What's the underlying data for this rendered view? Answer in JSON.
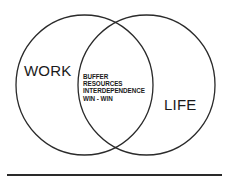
{
  "diagram": {
    "type": "venn",
    "sets": [
      {
        "id": "work",
        "label": "WORK"
      },
      {
        "id": "life",
        "label": "LIFE"
      }
    ],
    "intersection": {
      "sets": [
        "work",
        "life"
      ],
      "items": [
        "BUFFER",
        "RESOURCES",
        "INTERDEPENDENCE",
        "WIN - WIN"
      ]
    },
    "colors": {
      "stroke": "#2a2a2a",
      "text": "#1a1a1a",
      "background": "#ffffff"
    }
  }
}
